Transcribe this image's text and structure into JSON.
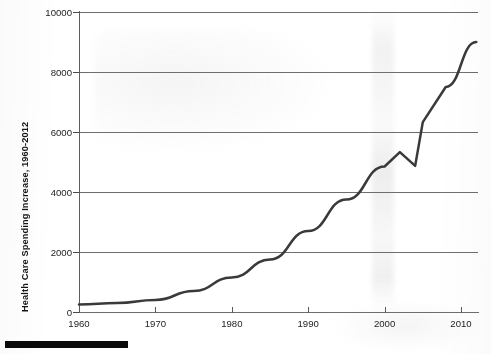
{
  "chart_data": {
    "type": "line",
    "title": "",
    "subtitle": "",
    "xlabel": "",
    "ylabel": "Health Care Spending Increase, 1960-2012",
    "x": [
      1960,
      1965,
      1970,
      1975,
      1980,
      1985,
      1990,
      1995,
      2000,
      2002,
      2004,
      2005,
      2008,
      2012
    ],
    "values": [
      250,
      300,
      400,
      700,
      1150,
      1750,
      2700,
      3750,
      4850,
      5330,
      4870,
      6330,
      7500,
      9000
    ],
    "xlim": [
      1960,
      2012
    ],
    "ylim": [
      0,
      10000
    ],
    "xticks": [
      1960,
      1970,
      1980,
      1990,
      2000,
      2010
    ],
    "yticks": [
      0,
      2000,
      4000,
      6000,
      8000,
      10000
    ],
    "xtick_labels": [
      "1960",
      "1970",
      "1980",
      "1990",
      "2000",
      "2010"
    ],
    "ytick_labels": [
      "0",
      "2000",
      "4000",
      "6000",
      "8000",
      "10000"
    ],
    "grid": true,
    "grid_axis": "y",
    "legend": false,
    "legend_position": "none",
    "series": [
      {
        "name": "Health Care Spending Increase",
        "color": "#3a3a3a",
        "values": [
          250,
          300,
          400,
          700,
          1150,
          1750,
          2700,
          3750,
          4850,
          5330,
          4870,
          6330,
          7500,
          9000
        ]
      }
    ],
    "annotations": []
  },
  "colors": {
    "line": "#3a3a3a",
    "grid": "#6e6e6e",
    "axis": "#5c5c5c",
    "text": "#1d1d1d",
    "bar": "#0a0a0a",
    "background": "#ffffff"
  },
  "figure": {
    "y_axis_title": "Health Care Spending Increase, 1960-2012"
  }
}
